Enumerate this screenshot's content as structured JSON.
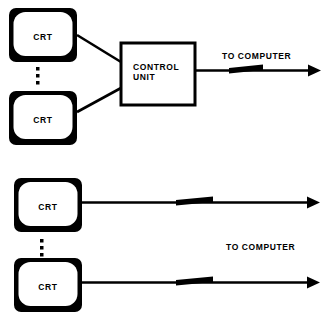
{
  "figure": {
    "title": "",
    "background_color": "#ffffff",
    "ink_color": "#000000",
    "width": 324,
    "height": 321
  },
  "sections": [
    {
      "id": "clustered-control-unit",
      "description": "Multiple CRT terminals wired through a shared control unit to the computer",
      "terminals": [
        {
          "label": "CRT"
        },
        {
          "label": "CRT"
        }
      ],
      "ellipsis": "⋮",
      "control_unit": {
        "line1": "CONTROL",
        "line2": "UNIT"
      },
      "output_label": "TO COMPUTER"
    },
    {
      "id": "direct-connection",
      "description": "Each CRT terminal wired directly to the computer on its own line",
      "terminals": [
        {
          "label": "CRT"
        },
        {
          "label": "CRT"
        }
      ],
      "ellipsis": "⋮",
      "output_label": "TO COMPUTER"
    }
  ]
}
